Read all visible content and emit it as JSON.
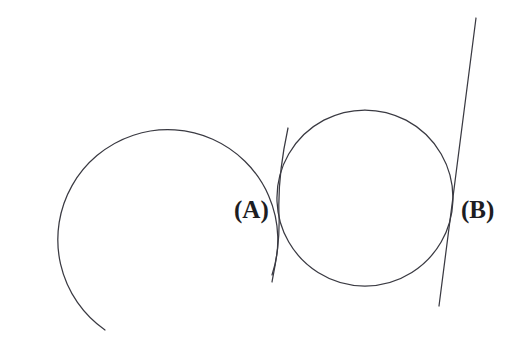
{
  "figure": {
    "background_color": "#ffffff",
    "stroke_color": "#3a3a42",
    "label_color": "#1d1d22",
    "width": 521,
    "height": 345,
    "labels": [
      {
        "id": "a",
        "text": "(A)",
        "x": 234,
        "y": 197
      },
      {
        "id": "b",
        "text": "(B)",
        "x": 461,
        "y": 197
      }
    ],
    "shapes": {
      "large_circle": {
        "name": "large-circle",
        "type": "arc",
        "center_x": 160,
        "center_y": 198,
        "radius": 110,
        "start_angle_deg": 45,
        "end_angle_deg": 352,
        "closed": false,
        "path": "M 272 275 A 110 110 0 1 0 105 330"
      },
      "small_circle": {
        "name": "small-circle",
        "type": "circle",
        "center_x": 365,
        "center_y": 198,
        "radius": 88,
        "closed": true,
        "path": "M 365 110 A 88 88 0 1 1 364.9 110"
      },
      "tangent_line_a": {
        "name": "tangent-line-a",
        "type": "curve",
        "description": "short curve through point A on the left side of the small circle",
        "from_x": 288,
        "from_y": 128,
        "to_x": 272,
        "to_y": 282,
        "path": "M 288 128 C 280 165, 278 190, 279 215 C 280 245, 275 265, 272 282"
      },
      "tangent_line_b": {
        "name": "tangent-line-b",
        "type": "line",
        "description": "straight line through point B on the right side of the small circle",
        "from_x": 476,
        "from_y": 18,
        "to_x": 439,
        "to_y": 306,
        "path": "M 476 18 L 439 306"
      }
    },
    "intersections": [
      {
        "label": "(A)",
        "x": 283,
        "y": 200,
        "description": "point A where the curve meets the circles"
      },
      {
        "label": "(B)",
        "x": 452,
        "y": 205,
        "description": "point B where the line meets the small circle"
      }
    ]
  }
}
